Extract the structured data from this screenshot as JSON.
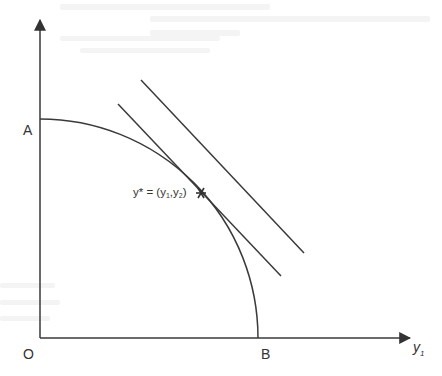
{
  "diagram": {
    "type": "production-possibility-frontier",
    "colors": {
      "line": "#3a3a3a",
      "text": "#333333",
      "background": "#ffffff",
      "bleed_through": "#f4f4f4"
    },
    "axes": {
      "origin_label": "O",
      "x_axis_label": "y",
      "x_axis_label_sub": "1"
    },
    "frontier": {
      "y_intercept_label": "A",
      "x_intercept_label": "B",
      "shape": "concave quarter arc from A to B"
    },
    "lines": [
      {
        "name": "tangent-isorevenue-line",
        "description": "tangent to frontier at y*"
      },
      {
        "name": "higher-isorevenue-line",
        "description": "parallel line further from origin"
      }
    ],
    "point": {
      "marker": "*",
      "label_prefix": "y* = (y",
      "sub1": "1",
      "mid": ",y",
      "sub2": "2",
      "suffix": ")"
    }
  }
}
